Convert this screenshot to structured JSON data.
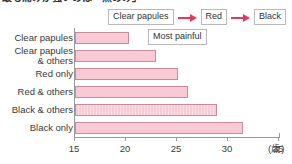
{
  "title": {
    "text": "最も痛みが強いのは「黒のみ」",
    "cropped": true
  },
  "legend": {
    "items": [
      "Clear",
      "Red",
      "Black"
    ],
    "arrow_color": "#e8365f",
    "separator": "arrow-right"
  },
  "annotation": {
    "most_painful_label": "Most painful"
  },
  "colors": {
    "bar_fill": "#f9c9d6",
    "bar_border": "#c78c9c",
    "axis": "#9a9a9a",
    "text": "#3a3a3a",
    "arrow": "#e8365f"
  },
  "chart_data": {
    "type": "bar",
    "orientation": "horizontal",
    "title": "",
    "xlabel": "(歳)",
    "ylabel": "",
    "xlim": [
      15,
      35
    ],
    "xticks": [
      15,
      20,
      25,
      30,
      35
    ],
    "grid": false,
    "legend_position": "top-right",
    "categories": [
      "Clear papules",
      "Clear papules & others",
      "Red only",
      "Red & others",
      "Black & others",
      "Black only"
    ],
    "category_lines": [
      [
        "Clear papules"
      ],
      [
        "Clear papules",
        "& others"
      ],
      [
        "Red only"
      ],
      [
        "Red & others"
      ],
      [
        "Black & others"
      ],
      [
        "Black only"
      ]
    ],
    "values": [
      20.3,
      22.9,
      25.1,
      26.1,
      28.9,
      31.5
    ],
    "unit": "years",
    "annotations": [
      "Most painful"
    ],
    "series": [
      {
        "name": "Mean age",
        "values": [
          20.3,
          22.9,
          25.1,
          26.1,
          28.9,
          31.5
        ]
      }
    ]
  }
}
